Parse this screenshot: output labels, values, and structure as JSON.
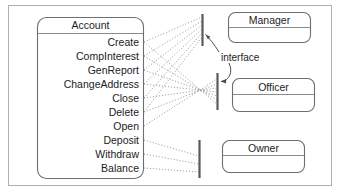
{
  "diagram": {
    "frame": {
      "label": "diagram-frame"
    },
    "colors": {
      "background": "#ffffff",
      "frame_border": "#b0b0b0",
      "box_border": "#6e6e6e",
      "separator": "#8a8a8a",
      "interface_bar": "#5a5a5a",
      "dotted_link": "#8d8d8d",
      "arrow": "#4a4a4a",
      "text": "#1c1c1c"
    },
    "classes": [
      {
        "id": "account",
        "name": "Account",
        "members": [
          "Create",
          "CompInterest",
          "GenReport",
          "ChangeAddress",
          "Close",
          "Delete",
          "Open",
          "Deposit",
          "Withdraw",
          "Balance"
        ]
      },
      {
        "id": "manager",
        "name": "Manager",
        "members": []
      },
      {
        "id": "officer",
        "name": "Officer",
        "members": []
      },
      {
        "id": "owner",
        "name": "Owner",
        "members": []
      }
    ],
    "annotations": [
      {
        "id": "interface-label",
        "text": "interface"
      }
    ],
    "interfaces": [
      {
        "id": "manager-interface",
        "for": "Manager"
      },
      {
        "id": "officer-interface",
        "for": "Officer"
      },
      {
        "id": "owner-interface",
        "for": "Owner"
      }
    ],
    "links": {
      "manager_members": [
        "Create",
        "CompInterest",
        "GenReport",
        "ChangeAddress",
        "Close",
        "Delete"
      ],
      "officer_members": [
        "Create",
        "CompInterest",
        "GenReport",
        "ChangeAddress",
        "Close",
        "Delete",
        "Open"
      ],
      "owner_members": [
        "Deposit",
        "Withdraw",
        "Balance"
      ]
    }
  }
}
